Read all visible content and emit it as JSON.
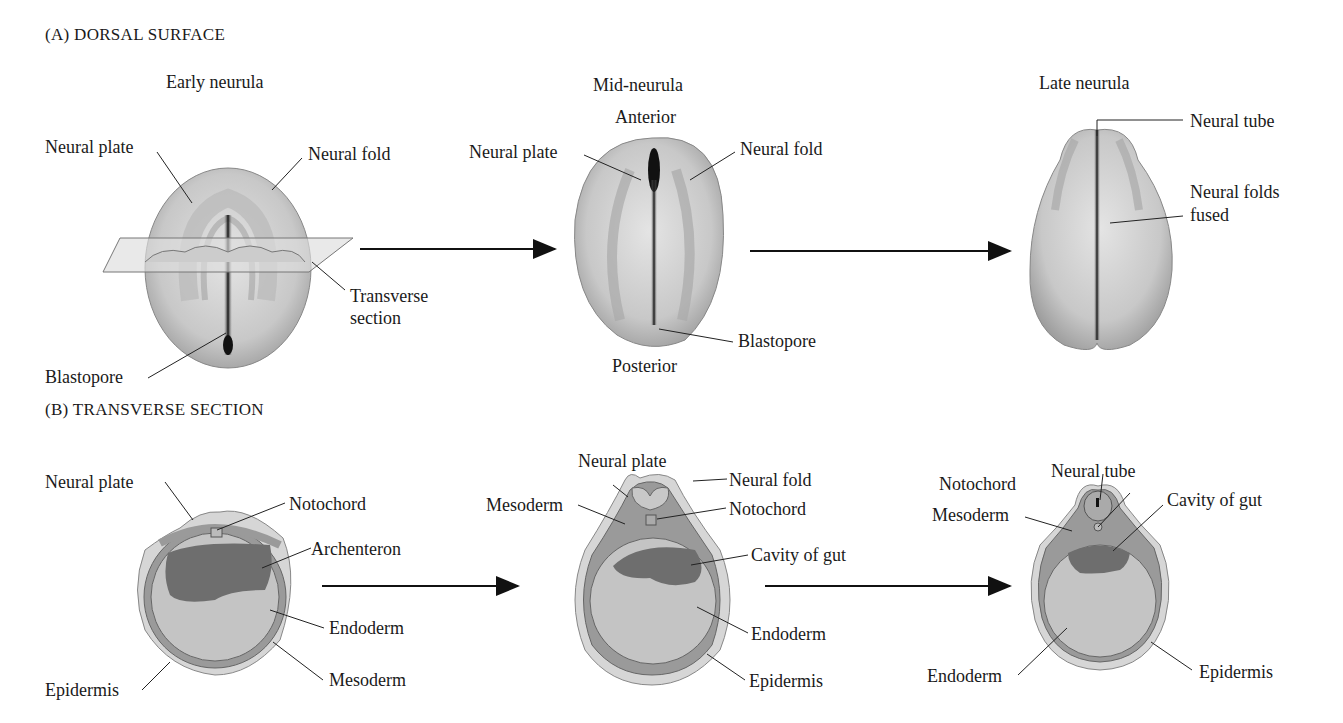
{
  "panel_a": {
    "heading": "(A)  DORSAL SURFACE",
    "early": {
      "title": "Early neurula",
      "labels": {
        "neural_plate": "Neural plate",
        "neural_fold": "Neural fold",
        "transverse_1": "Transverse",
        "transverse_2": "section",
        "blastopore": "Blastopore"
      }
    },
    "mid": {
      "title": "Mid-neurula",
      "anterior": "Anterior",
      "posterior": "Posterior",
      "labels": {
        "neural_plate": "Neural plate",
        "neural_fold": "Neural fold",
        "blastopore": "Blastopore"
      }
    },
    "late": {
      "title": "Late neurula",
      "labels": {
        "neural_tube": "Neural tube",
        "folds_fused_1": "Neural folds",
        "folds_fused_2": "fused"
      }
    }
  },
  "panel_b": {
    "heading": "(B)  TRANSVERSE SECTION",
    "early": {
      "labels": {
        "neural_plate": "Neural plate",
        "notochord": "Notochord",
        "archenteron": "Archenteron",
        "endoderm": "Endoderm",
        "mesoderm": "Mesoderm",
        "epidermis": "Epidermis"
      }
    },
    "mid": {
      "labels": {
        "neural_plate": "Neural plate",
        "neural_fold": "Neural fold",
        "mesoderm": "Mesoderm",
        "notochord": "Notochord",
        "cavity": "Cavity of gut",
        "endoderm": "Endoderm",
        "epidermis": "Epidermis"
      }
    },
    "late": {
      "labels": {
        "notochord": "Notochord",
        "neural_tube": "Neural tube",
        "mesoderm": "Mesoderm",
        "cavity": "Cavity of gut",
        "endoderm": "Endoderm",
        "epidermis": "Epidermis"
      }
    }
  },
  "colors": {
    "epidermis": "#d6d6d6",
    "mesoderm": "#9a9a9a",
    "endoderm": "#c4c4c4",
    "cavity": "#6e6e6e",
    "embryo_light": "#e2e2e2",
    "embryo_dark": "#333333"
  }
}
